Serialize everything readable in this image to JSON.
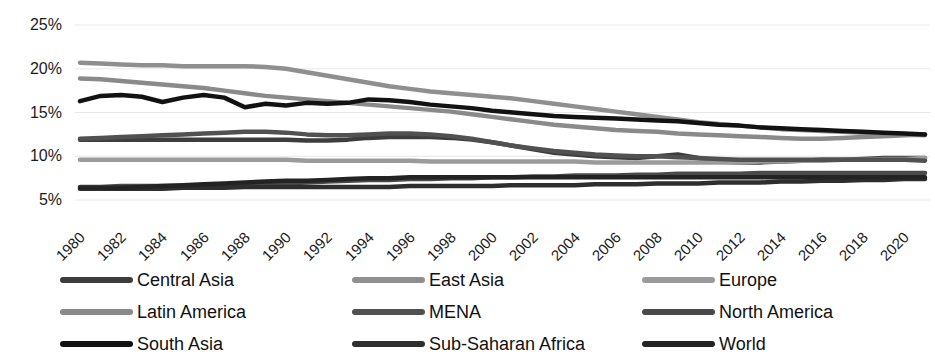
{
  "chart_data": {
    "type": "line",
    "title": "",
    "xlabel": "",
    "ylabel": "",
    "grid": true,
    "legend_position": "bottom",
    "ylim": [
      5,
      25
    ],
    "ytick_labels": [
      "25%",
      "20%",
      "15%",
      "10%",
      "5%"
    ],
    "ytick_values": [
      25,
      20,
      15,
      10,
      5
    ],
    "xlim": [
      1980,
      2021
    ],
    "xtick_labels": [
      "1980",
      "1982",
      "1984",
      "1986",
      "1988",
      "1990",
      "1992",
      "1994",
      "1996",
      "1998",
      "2000",
      "2002",
      "2004",
      "2006",
      "2008",
      "2010",
      "2012",
      "2014",
      "2016",
      "2018",
      "2020"
    ],
    "x": [
      1980,
      1981,
      1982,
      1983,
      1984,
      1985,
      1986,
      1987,
      1988,
      1989,
      1990,
      1991,
      1992,
      1993,
      1994,
      1995,
      1996,
      1997,
      1998,
      1999,
      2000,
      2001,
      2002,
      2003,
      2004,
      2005,
      2006,
      2007,
      2008,
      2009,
      2010,
      2011,
      2012,
      2013,
      2014,
      2015,
      2016,
      2017,
      2018,
      2019,
      2020,
      2021
    ],
    "series": [
      {
        "name": "Central Asia",
        "color": "#3d3d3d",
        "values": [
          11.9,
          11.9,
          11.9,
          11.9,
          11.9,
          11.9,
          11.9,
          11.9,
          11.9,
          11.9,
          11.9,
          11.8,
          11.8,
          11.9,
          12.1,
          12.2,
          12.2,
          12.2,
          12.1,
          11.9,
          11.6,
          11.2,
          10.8,
          10.4,
          10.2,
          10.0,
          9.9,
          9.8,
          10.0,
          10.2,
          9.8,
          9.4,
          9.3,
          9.3,
          9.4,
          9.5,
          9.6,
          9.6,
          9.7,
          9.8,
          9.8,
          9.8
        ]
      },
      {
        "name": "East Asia",
        "color": "#8f8f8f",
        "values": [
          20.7,
          20.6,
          20.5,
          20.4,
          20.4,
          20.3,
          20.3,
          20.3,
          20.3,
          20.2,
          20.0,
          19.6,
          19.2,
          18.8,
          18.4,
          18.0,
          17.7,
          17.4,
          17.2,
          17.0,
          16.8,
          16.6,
          16.3,
          16.0,
          15.7,
          15.4,
          15.1,
          14.8,
          14.5,
          14.2,
          13.9,
          13.7,
          13.5,
          13.3,
          13.1,
          13.0,
          12.9,
          12.8,
          12.7,
          12.6,
          12.5,
          12.4
        ]
      },
      {
        "name": "Europe",
        "color": "#9b9b9b",
        "values": [
          9.6,
          9.6,
          9.6,
          9.6,
          9.6,
          9.6,
          9.6,
          9.6,
          9.6,
          9.6,
          9.6,
          9.5,
          9.5,
          9.5,
          9.5,
          9.5,
          9.5,
          9.4,
          9.4,
          9.4,
          9.4,
          9.4,
          9.4,
          9.4,
          9.4,
          9.3,
          9.3,
          9.3,
          9.3,
          9.3,
          9.3,
          9.3,
          9.3,
          9.4,
          9.4,
          9.5,
          9.5,
          9.6,
          9.6,
          9.7,
          9.7,
          9.8
        ]
      },
      {
        "name": "Latin America",
        "color": "#8a8a8a",
        "values": [
          18.9,
          18.8,
          18.6,
          18.4,
          18.2,
          18.0,
          17.8,
          17.5,
          17.2,
          16.9,
          16.7,
          16.5,
          16.3,
          16.1,
          15.9,
          15.7,
          15.5,
          15.3,
          15.1,
          14.8,
          14.5,
          14.2,
          13.9,
          13.6,
          13.4,
          13.2,
          13.0,
          12.9,
          12.8,
          12.6,
          12.5,
          12.4,
          12.3,
          12.2,
          12.1,
          12.0,
          12.0,
          12.1,
          12.2,
          12.3,
          12.4,
          12.5
        ]
      },
      {
        "name": "MENA",
        "color": "#515151",
        "values": [
          12.0,
          12.1,
          12.2,
          12.3,
          12.4,
          12.5,
          12.6,
          12.7,
          12.8,
          12.8,
          12.7,
          12.5,
          12.4,
          12.4,
          12.5,
          12.6,
          12.6,
          12.5,
          12.3,
          12.0,
          11.6,
          11.2,
          10.9,
          10.6,
          10.4,
          10.2,
          10.1,
          10.0,
          10.0,
          9.9,
          9.8,
          9.7,
          9.6,
          9.6,
          9.6,
          9.6,
          9.6,
          9.6,
          9.6,
          9.6,
          9.6,
          9.5
        ]
      },
      {
        "name": "North America",
        "color": "#4a4a4a",
        "values": [
          6.5,
          6.5,
          6.6,
          6.6,
          6.6,
          6.6,
          6.6,
          6.7,
          6.7,
          6.8,
          6.9,
          7.0,
          7.1,
          7.2,
          7.3,
          7.3,
          7.4,
          7.4,
          7.5,
          7.5,
          7.6,
          7.6,
          7.7,
          7.7,
          7.8,
          7.8,
          7.8,
          7.9,
          7.9,
          8.0,
          8.0,
          8.0,
          8.0,
          8.1,
          8.1,
          8.1,
          8.1,
          8.1,
          8.1,
          8.1,
          8.1,
          8.1
        ]
      },
      {
        "name": "South Asia",
        "color": "#121212",
        "values": [
          16.3,
          16.9,
          17.0,
          16.8,
          16.2,
          16.7,
          17.0,
          16.7,
          15.6,
          16.0,
          15.8,
          16.1,
          16.0,
          16.1,
          16.5,
          16.4,
          16.2,
          15.9,
          15.7,
          15.5,
          15.2,
          15.0,
          14.8,
          14.6,
          14.5,
          14.4,
          14.3,
          14.2,
          14.1,
          14.0,
          13.8,
          13.6,
          13.5,
          13.3,
          13.2,
          13.1,
          13.0,
          12.9,
          12.8,
          12.7,
          12.6,
          12.5
        ]
      },
      {
        "name": "Sub-Saharan Africa",
        "color": "#2e2e2e",
        "values": [
          6.3,
          6.3,
          6.3,
          6.3,
          6.3,
          6.4,
          6.4,
          6.4,
          6.5,
          6.5,
          6.5,
          6.5,
          6.5,
          6.5,
          6.5,
          6.5,
          6.6,
          6.6,
          6.6,
          6.6,
          6.6,
          6.7,
          6.7,
          6.7,
          6.7,
          6.8,
          6.8,
          6.8,
          6.9,
          6.9,
          6.9,
          7.0,
          7.0,
          7.0,
          7.1,
          7.1,
          7.2,
          7.2,
          7.3,
          7.3,
          7.4,
          7.4
        ]
      },
      {
        "name": "World",
        "color": "#232323",
        "values": [
          6.4,
          6.4,
          6.4,
          6.5,
          6.6,
          6.7,
          6.8,
          6.9,
          7.0,
          7.1,
          7.2,
          7.2,
          7.3,
          7.4,
          7.5,
          7.5,
          7.6,
          7.6,
          7.6,
          7.6,
          7.6,
          7.6,
          7.6,
          7.6,
          7.6,
          7.6,
          7.6,
          7.6,
          7.6,
          7.6,
          7.6,
          7.6,
          7.6,
          7.6,
          7.6,
          7.6,
          7.6,
          7.6,
          7.6,
          7.6,
          7.6,
          7.6
        ]
      }
    ]
  },
  "legend": {
    "items": [
      {
        "label": "Central Asia",
        "color": "#3d3d3d"
      },
      {
        "label": "East Asia",
        "color": "#8f8f8f"
      },
      {
        "label": "Europe",
        "color": "#9b9b9b"
      },
      {
        "label": "Latin America",
        "color": "#8a8a8a"
      },
      {
        "label": "MENA",
        "color": "#515151"
      },
      {
        "label": "North America",
        "color": "#4a4a4a"
      },
      {
        "label": "South Asia",
        "color": "#121212"
      },
      {
        "label": "Sub-Saharan Africa",
        "color": "#2e2e2e"
      },
      {
        "label": "World",
        "color": "#232323"
      }
    ]
  },
  "style": {
    "background": "#ffffff",
    "gridline_color": "#e8e8e8",
    "text_color": "#1c1c1c",
    "line_width": 4.5
  }
}
